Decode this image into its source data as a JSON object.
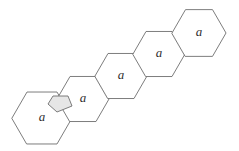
{
  "figure": {
    "title": "Hexagon chain diagram",
    "background_color": "#ffffff",
    "stroke_color": "#6e6e6e",
    "flap_fill_color": "#e6e6e6",
    "glyph_color": "#2f2f2f",
    "cell_count": 5
  },
  "cells": [
    {
      "id": "cell-1",
      "label": "a",
      "position": "lower-left",
      "center_x": 42,
      "center_y": 118,
      "radius": 30,
      "size": "large"
    },
    {
      "id": "cell-2",
      "label": "a",
      "position": "left-middle",
      "center_x": 83,
      "center_y": 99,
      "radius": 26,
      "size": "regular"
    },
    {
      "id": "cell-3",
      "label": "a",
      "position": "center",
      "center_x": 121,
      "center_y": 76,
      "radius": 26,
      "size": "regular"
    },
    {
      "id": "cell-4",
      "label": "a",
      "position": "right-middle",
      "center_x": 159,
      "center_y": 54,
      "radius": 26,
      "size": "regular"
    },
    {
      "id": "cell-5",
      "label": "a",
      "position": "upper-right",
      "center_x": 199,
      "center_y": 33,
      "radius": 27,
      "size": "regular"
    }
  ],
  "flap": {
    "id": "flap-1",
    "attached_to": "cell-1",
    "shape": "pentagon",
    "fill": "#e6e6e6",
    "points": "48,104 53,96 68,96 72,106 57,112"
  },
  "geometry": {
    "orientation": "pointy-left-right",
    "hex_points_template": "cx-r,cy cx-r/2,cy-h cx+r/2,cy-h cx+r,cy cx+r/2,cy+h cx-r/2,cy+h"
  }
}
